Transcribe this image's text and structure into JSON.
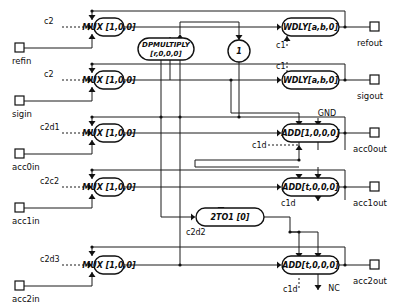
{
  "diagram": {
    "colors": {
      "line": "#1a1a1a",
      "block_stroke": "#111111",
      "block_fill": "#ffffff",
      "text": "#0d0d0d",
      "background": "#ffffff"
    },
    "rows": [
      {
        "id": "ref",
        "mux": {
          "label": "MUX [1,0,0]",
          "control": "c2"
        },
        "input_port": "refin",
        "output_block": {
          "label": "WDLY[a,b,0]",
          "control": "c1"
        },
        "output_port": "refout"
      },
      {
        "id": "sig",
        "mux": {
          "label": "MUX [1,0,0]",
          "control": "c2"
        },
        "input_port": "sigin",
        "output_block": {
          "label": "WDLY[a,b,0]",
          "control": "c1"
        },
        "output_port": "sigout"
      },
      {
        "id": "acc0",
        "mux": {
          "label": "MUX [1,0,0]",
          "control": "c2d1"
        },
        "input_port": "acc0in",
        "output_block": {
          "label": "ADD[1,0,0,0]",
          "control": "c1d"
        },
        "output_port": "acc0out",
        "aux_input": "GND"
      },
      {
        "id": "acc1",
        "mux": {
          "label": "MUX [1,0,0]",
          "control": "c2c2"
        },
        "input_port": "acc1in",
        "output_block": {
          "label": "ADD[t,0,0,0]",
          "control": "c1d"
        },
        "output_port": "acc1out"
      },
      {
        "id": "acc2",
        "mux": {
          "label": "MUX [1,0,0]",
          "control": "c2d3"
        },
        "input_port": "acc2in",
        "output_block": {
          "label": "ADD[t,0,0,0]",
          "control": "c1d"
        },
        "output_port": "acc2out",
        "aux_output": "NC"
      }
    ],
    "center_blocks": [
      {
        "id": "dpmultiply",
        "label_line1": "DPMULTIPLY",
        "label_line2": "[r,0,0,0]"
      },
      {
        "id": "constant-one",
        "label": "1"
      },
      {
        "id": "mux2to1",
        "label": "2TO1  [0]",
        "control": "c2d2"
      }
    ]
  }
}
